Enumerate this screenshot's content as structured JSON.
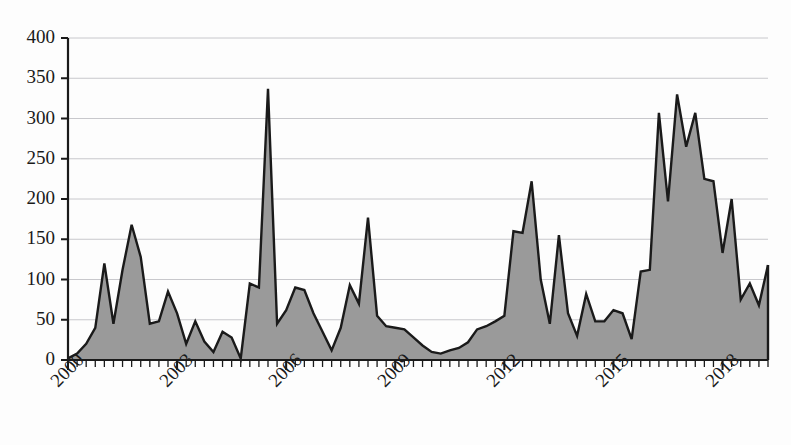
{
  "chart_data": {
    "type": "area",
    "title": "",
    "subtitle": "",
    "xlabel": "",
    "ylabel": "",
    "xlim": [
      2000,
      2019.25
    ],
    "ylim": [
      0,
      400
    ],
    "grid": true,
    "legend": null,
    "series_color": "#9a9a9a",
    "line_color": "#1a1a1a",
    "grid_color": "#c8c8cc",
    "axis_color": "#1a1a1a",
    "background_color": "#fdfdfd",
    "y_ticks": [
      0,
      50,
      100,
      150,
      200,
      250,
      300,
      350,
      400
    ],
    "y_tick_labels": [
      "0",
      "50",
      "100",
      "150",
      "200",
      "250",
      "300",
      "350",
      "400"
    ],
    "x_ticks": [
      2000,
      2003,
      2006,
      2009,
      2012,
      2015,
      2018
    ],
    "x_tick_labels": [
      "2000",
      "2003",
      "2006",
      "2009",
      "2012",
      "2015",
      "2018"
    ],
    "x_minor_tick_interval": 0.25,
    "x_label_rotation_deg": -45,
    "point_interval_years": 0.25,
    "series": [
      {
        "name": "value",
        "x": [
          2000.0,
          2000.25,
          2000.5,
          2000.75,
          2001.0,
          2001.25,
          2001.5,
          2001.75,
          2002.0,
          2002.25,
          2002.5,
          2002.75,
          2003.0,
          2003.25,
          2003.5,
          2003.75,
          2004.0,
          2004.25,
          2004.5,
          2004.75,
          2005.0,
          2005.25,
          2005.5,
          2005.75,
          2006.0,
          2006.25,
          2006.5,
          2006.75,
          2007.0,
          2007.25,
          2007.5,
          2007.75,
          2008.0,
          2008.25,
          2008.5,
          2008.75,
          2009.0,
          2009.25,
          2009.5,
          2009.75,
          2010.0,
          2010.25,
          2010.5,
          2010.75,
          2011.0,
          2011.25,
          2011.5,
          2011.75,
          2012.0,
          2012.25,
          2012.5,
          2012.75,
          2013.0,
          2013.25,
          2013.5,
          2013.75,
          2014.0,
          2014.25,
          2014.5,
          2014.75,
          2015.0,
          2015.25,
          2015.5,
          2015.75,
          2016.0,
          2016.25,
          2016.5,
          2016.75,
          2017.0,
          2017.25,
          2017.5,
          2017.75,
          2018.0,
          2018.25,
          2018.5,
          2018.75,
          2019.0,
          2019.25
        ],
        "values": [
          2,
          8,
          20,
          40,
          120,
          45,
          112,
          168,
          128,
          45,
          48,
          85,
          58,
          20,
          48,
          23,
          10,
          35,
          28,
          2,
          95,
          90,
          337,
          45,
          62,
          90,
          87,
          58,
          35,
          12,
          40,
          93,
          70,
          177,
          55,
          42,
          40,
          38,
          28,
          18,
          10,
          8,
          12,
          15,
          22,
          38,
          42,
          48,
          55,
          160,
          158,
          222,
          100,
          45,
          155,
          58,
          30,
          82,
          48,
          48,
          62,
          58,
          26,
          110,
          112,
          307,
          197,
          330,
          265,
          307,
          225,
          222,
          133,
          200,
          75,
          95,
          68,
          118
        ]
      }
    ]
  },
  "axes": {
    "y_axis_name": "y-axis",
    "x_axis_name": "x-axis"
  }
}
